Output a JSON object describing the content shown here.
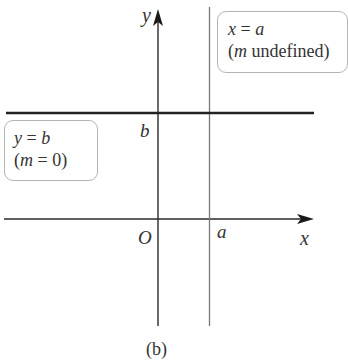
{
  "figure": {
    "caption": "(b)",
    "axes": {
      "x_label": "x",
      "y_label": "y",
      "origin_label": "O",
      "x_tick_label": "a",
      "y_tick_label": "b"
    },
    "lines": [
      {
        "name": "horizontal-line",
        "equation": "y = b",
        "slope_note": "(m = 0)"
      },
      {
        "name": "vertical-line",
        "equation": "x = a",
        "slope_note": "(m undefined)"
      }
    ],
    "boxes": {
      "horizontal": {
        "line1_var": "y",
        "line1_eq": " = ",
        "line1_val": "b",
        "line2_open": "(",
        "line2_var": "m",
        "line2_rest": " = 0)"
      },
      "vertical": {
        "line1_var": "x",
        "line1_eq": " = ",
        "line1_val": "a",
        "line2_open": "(",
        "line2_var": "m",
        "line2_rest": " undefined)"
      }
    },
    "colors": {
      "axis": "#2a2a2a",
      "vertical_line": "#777777",
      "horizontal_line": "#222222",
      "box_border": "#b5b5b5"
    }
  }
}
